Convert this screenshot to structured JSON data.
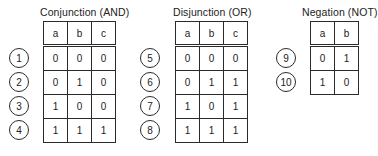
{
  "tables": [
    {
      "title": "Conjunction (AND)",
      "headers": [
        "a",
        "b",
        "c"
      ],
      "rows": [
        {
          "id": "1",
          "values": [
            "0",
            "0",
            "0"
          ]
        },
        {
          "id": "2",
          "values": [
            "0",
            "1",
            "0"
          ]
        },
        {
          "id": "3",
          "values": [
            "1",
            "0",
            "0"
          ]
        },
        {
          "id": "4",
          "values": [
            "1",
            "1",
            "1"
          ]
        }
      ]
    },
    {
      "title": "Disjunction (OR)",
      "headers": [
        "a",
        "b",
        "c"
      ],
      "rows": [
        {
          "id": "5",
          "values": [
            "0",
            "0",
            "0"
          ]
        },
        {
          "id": "6",
          "values": [
            "0",
            "1",
            "1"
          ]
        },
        {
          "id": "7",
          "values": [
            "1",
            "0",
            "1"
          ]
        },
        {
          "id": "8",
          "values": [
            "1",
            "1",
            "1"
          ]
        }
      ]
    },
    {
      "title": "Negation (NOT)",
      "headers": [
        "a",
        "b"
      ],
      "rows": [
        {
          "id": "9",
          "values": [
            "0",
            "1"
          ]
        },
        {
          "id": "10",
          "values": [
            "1",
            "0"
          ]
        }
      ]
    }
  ]
}
